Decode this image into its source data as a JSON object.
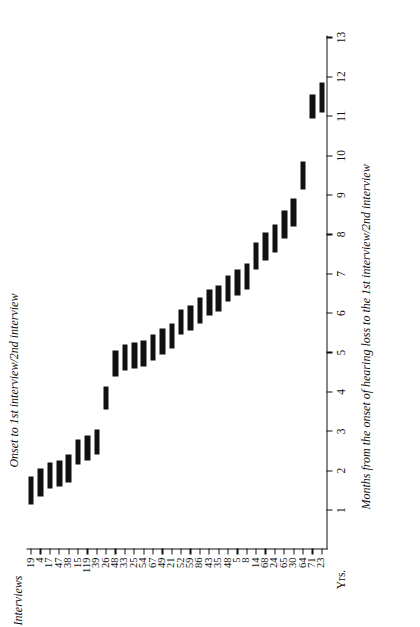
{
  "figure": {
    "series_title": "Onset to 1st interview/2nd interview",
    "x_axis_title": "Months from the onset of hearing loss to the 1st interview/2nd interview",
    "y_axis_title": "Interviews",
    "x_unit_label": "Yrs.",
    "background_color": "#ffffff",
    "bar_color": "#111111"
  },
  "chart_data": {
    "type": "bar",
    "orientation": "horizontal-range",
    "title": "Onset to 1st interview/2nd interview",
    "xlabel": "Months from the onset of hearing loss to the 1st interview/2nd interview",
    "ylabel": "Interviews",
    "x_unit": "Yrs.",
    "xlim": [
      0,
      13
    ],
    "xticks": [
      1,
      2,
      3,
      4,
      5,
      6,
      7,
      8,
      9,
      10,
      11,
      12,
      13
    ],
    "xticklabels": [
      "1",
      "2",
      "3",
      "4",
      "5",
      "6",
      "7",
      "8",
      "9",
      "10",
      "11",
      "12",
      "13"
    ],
    "grid": false,
    "legend": "none",
    "categories": [
      "19",
      "4",
      "17",
      "47",
      "38",
      "15",
      "119",
      "39",
      "26",
      "48",
      "33",
      "25",
      "54",
      "67",
      "49",
      "21",
      "52",
      "59",
      "86",
      "43",
      "35",
      "48",
      "5",
      "8",
      "14",
      "68",
      "24",
      "65",
      "30",
      "64",
      "71",
      "23"
    ],
    "series": [
      {
        "name": "Onset to 1st interview / 2nd interview (years)",
        "start": [
          1.15,
          1.35,
          1.55,
          1.6,
          1.7,
          2.15,
          2.25,
          2.4,
          3.55,
          4.4,
          4.55,
          4.6,
          4.65,
          4.8,
          4.95,
          5.1,
          5.45,
          5.55,
          5.75,
          5.95,
          6.05,
          6.3,
          6.45,
          6.6,
          7.1,
          7.35,
          7.55,
          7.9,
          8.2,
          9.15,
          10.95,
          11.1
        ],
        "end": [
          1.85,
          2.05,
          2.2,
          2.25,
          2.4,
          2.8,
          2.9,
          3.05,
          4.15,
          5.05,
          5.2,
          5.25,
          5.3,
          5.45,
          5.6,
          5.75,
          6.1,
          6.2,
          6.4,
          6.6,
          6.7,
          6.95,
          7.1,
          7.25,
          7.8,
          8.05,
          8.25,
          8.6,
          8.9,
          9.85,
          11.55,
          11.85
        ]
      }
    ]
  }
}
